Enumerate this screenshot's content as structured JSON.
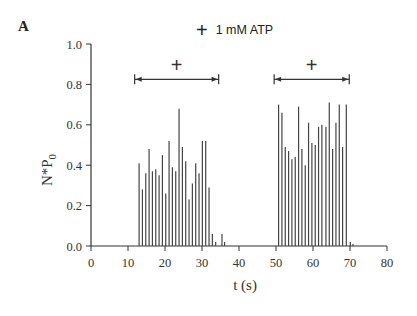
{
  "panel_label": "A",
  "legend": {
    "symbol": "+",
    "label": "1 mM ATP"
  },
  "chart_data": {
    "type": "bar",
    "title": "",
    "xlabel": "t (s)",
    "ylabel": "N*P0",
    "xlim": [
      0,
      80
    ],
    "ylim": [
      0,
      1.0
    ],
    "x_ticks": [
      0,
      10,
      20,
      30,
      40,
      50,
      60,
      70,
      80
    ],
    "y_ticks": [
      "0.0",
      "0.2",
      "0.4",
      "0.6",
      "0.8",
      "1.0"
    ],
    "grid": false,
    "legend_position": "top center",
    "annotations": [
      {
        "type": "interval",
        "label": "+",
        "from": 11.8,
        "to": 34.5,
        "y": 0.825
      },
      {
        "type": "interval",
        "label": "+",
        "from": 49.5,
        "to": 69.8,
        "y": 0.825
      }
    ],
    "series": [
      {
        "name": "N*P0",
        "x": [
          13.0,
          13.9,
          14.8,
          15.7,
          16.6,
          17.5,
          18.4,
          19.3,
          20.2,
          21.1,
          22.0,
          22.9,
          23.8,
          24.7,
          25.6,
          26.5,
          27.4,
          28.3,
          29.2,
          30.1,
          31.0,
          31.9,
          32.8,
          33.7,
          35.4,
          36.1,
          50.7,
          51.6,
          52.5,
          53.4,
          54.3,
          55.2,
          56.1,
          57.0,
          57.9,
          58.8,
          59.7,
          60.6,
          61.5,
          62.4,
          63.5,
          64.4,
          65.3,
          66.2,
          67.1,
          68.0,
          69.0,
          70.1,
          70.8
        ],
        "values": [
          0.41,
          0.28,
          0.36,
          0.48,
          0.37,
          0.38,
          0.35,
          0.45,
          0.26,
          0.52,
          0.39,
          0.37,
          0.68,
          0.49,
          0.42,
          0.23,
          0.31,
          0.41,
          0.36,
          0.52,
          0.52,
          0.29,
          0.06,
          0.02,
          0.06,
          0.02,
          0.7,
          0.66,
          0.49,
          0.47,
          0.43,
          0.44,
          0.69,
          0.48,
          0.4,
          0.61,
          0.51,
          0.5,
          0.59,
          0.6,
          0.59,
          0.71,
          0.48,
          0.61,
          0.7,
          0.49,
          0.7,
          0.02,
          0.01
        ]
      }
    ]
  }
}
